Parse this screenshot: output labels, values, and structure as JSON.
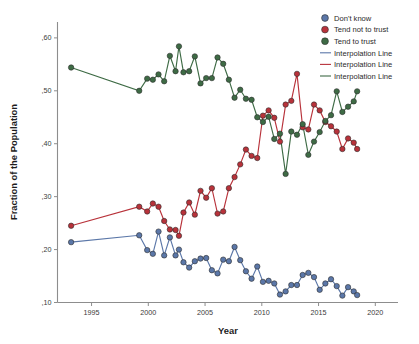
{
  "chart_data": {
    "type": "line",
    "title": "",
    "xlabel": "Year",
    "ylabel": "Fraction of the Population",
    "xlim": [
      1992,
      2022
    ],
    "ylim": [
      0.1,
      0.63
    ],
    "grid": false,
    "legend_position": "top-right",
    "x_ticks": [
      "1995",
      "2000",
      "2005",
      "2010",
      "2015",
      "2020"
    ],
    "x_tick_values": [
      1995,
      2000,
      2005,
      2010,
      2015,
      2020
    ],
    "y_ticks": [
      ",10",
      ",20",
      ",30",
      ",40",
      ",50",
      ",60"
    ],
    "y_tick_values": [
      0.1,
      0.2,
      0.3,
      0.4,
      0.5,
      0.6
    ],
    "colors": {
      "dont_know": "#5b77a8",
      "tend_not_to_trust": "#b8323a",
      "tend_to_trust": "#3e6b45"
    },
    "series": [
      {
        "name": "Don't know",
        "color": "#5b77a8",
        "x": [
          1993.2,
          1999.2,
          1999.9,
          2000.4,
          2000.9,
          2001.4,
          2001.9,
          2002.4,
          2002.7,
          2003.1,
          2003.6,
          2004.1,
          2004.6,
          2005.1,
          2005.6,
          2006.1,
          2006.6,
          2007.1,
          2007.6,
          2008.1,
          2008.6,
          2009.1,
          2009.6,
          2010.1,
          2010.6,
          2011.1,
          2011.6,
          2012.1,
          2012.6,
          2013.1,
          2013.6,
          2014.1,
          2014.6,
          2015.1,
          2015.6,
          2016.1,
          2016.6,
          2017.1,
          2017.6,
          2018.1,
          2018.4
        ],
        "values": [
          0.214,
          0.227,
          0.199,
          0.192,
          0.234,
          0.189,
          0.223,
          0.189,
          0.2,
          0.176,
          0.166,
          0.178,
          0.183,
          0.184,
          0.161,
          0.155,
          0.181,
          0.178,
          0.205,
          0.18,
          0.159,
          0.145,
          0.168,
          0.139,
          0.141,
          0.136,
          0.115,
          0.121,
          0.133,
          0.133,
          0.152,
          0.156,
          0.148,
          0.124,
          0.136,
          0.144,
          0.131,
          0.113,
          0.129,
          0.121,
          0.114
        ]
      },
      {
        "name": "Tend not to trust",
        "color": "#b8323a",
        "x": [
          1993.2,
          1999.2,
          1999.9,
          2000.4,
          2000.9,
          2001.4,
          2001.9,
          2002.4,
          2002.7,
          2003.1,
          2003.6,
          2004.1,
          2004.6,
          2005.1,
          2005.6,
          2006.1,
          2006.6,
          2007.1,
          2007.6,
          2008.1,
          2008.6,
          2009.1,
          2009.6,
          2010.1,
          2010.6,
          2011.1,
          2011.6,
          2012.1,
          2012.6,
          2013.1,
          2013.6,
          2014.1,
          2014.6,
          2015.1,
          2015.6,
          2016.1,
          2016.6,
          2017.1,
          2017.6,
          2018.1,
          2018.4
        ],
        "values": [
          0.245,
          0.281,
          0.272,
          0.287,
          0.281,
          0.254,
          0.238,
          0.237,
          0.226,
          0.27,
          0.289,
          0.266,
          0.311,
          0.298,
          0.316,
          0.268,
          0.272,
          0.316,
          0.337,
          0.361,
          0.389,
          0.377,
          0.373,
          0.453,
          0.463,
          0.449,
          0.404,
          0.474,
          0.481,
          0.532,
          0.431,
          0.427,
          0.474,
          0.463,
          0.441,
          0.433,
          0.423,
          0.39,
          0.41,
          0.402,
          0.39
        ]
      },
      {
        "name": "Tend to trust",
        "color": "#3e6b45",
        "x": [
          1993.2,
          1999.2,
          1999.9,
          2000.4,
          2000.9,
          2001.4,
          2001.9,
          2002.4,
          2002.7,
          2003.1,
          2003.6,
          2004.1,
          2004.6,
          2005.1,
          2005.6,
          2006.1,
          2006.6,
          2007.1,
          2007.6,
          2008.1,
          2008.6,
          2009.1,
          2009.6,
          2010.1,
          2010.6,
          2011.1,
          2011.6,
          2012.1,
          2012.6,
          2013.1,
          2013.6,
          2014.1,
          2014.6,
          2015.1,
          2015.6,
          2016.1,
          2016.6,
          2017.1,
          2017.6,
          2018.1,
          2018.4
        ],
        "values": [
          0.544,
          0.5,
          0.523,
          0.521,
          0.531,
          0.518,
          0.566,
          0.537,
          0.584,
          0.535,
          0.537,
          0.565,
          0.514,
          0.524,
          0.524,
          0.563,
          0.551,
          0.521,
          0.487,
          0.502,
          0.485,
          0.483,
          0.45,
          0.441,
          0.451,
          0.409,
          0.419,
          0.343,
          0.423,
          0.417,
          0.437,
          0.379,
          0.404,
          0.422,
          0.443,
          0.454,
          0.499,
          0.46,
          0.47,
          0.48,
          0.499
        ]
      }
    ],
    "legend_entries": [
      {
        "label": "Don't know",
        "marker": "circle",
        "color": "#5b77a8"
      },
      {
        "label": "Tend not to trust",
        "marker": "circle",
        "color": "#b8323a"
      },
      {
        "label": "Tend to trust",
        "marker": "circle",
        "color": "#3e6b45"
      },
      {
        "label": "Interpolation Line",
        "marker": "line",
        "color": "#5b77a8"
      },
      {
        "label": "Interpolation Line",
        "marker": "line",
        "color": "#b8323a"
      },
      {
        "label": "Interpolation Line",
        "marker": "line",
        "color": "#3e6b45"
      }
    ]
  }
}
